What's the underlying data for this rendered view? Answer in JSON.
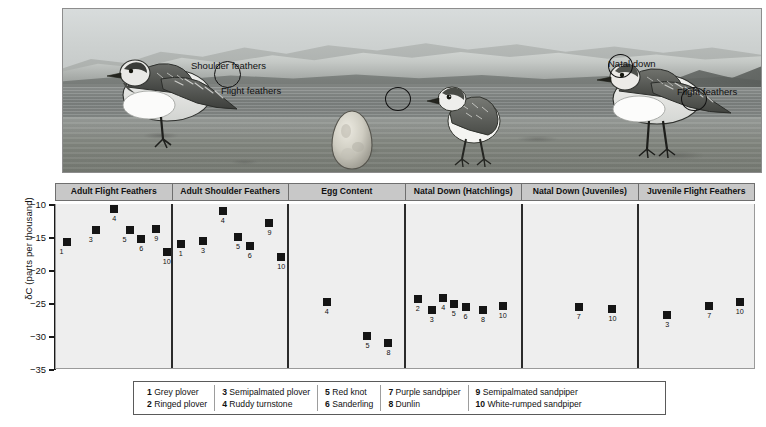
{
  "illustration": {
    "annotations": [
      {
        "label": "Shoulder feathers",
        "x": 191,
        "y": 60
      },
      {
        "label": "Flight feathers",
        "x": 221,
        "y": 85
      },
      {
        "label": "Natal down",
        "x": 608,
        "y": 58
      },
      {
        "label": "Flight feathers",
        "x": 677,
        "y": 86
      }
    ],
    "subjects": [
      "adult-plover-bird",
      "egg",
      "hatchling-chick",
      "juvenile-plover-bird"
    ],
    "scene": "arctic-tundra-shoreline-with-snowy-mountains"
  },
  "chart_data": {
    "type": "scatter",
    "title": "",
    "xlabel": "",
    "ylabel": "δC (parts per thousand)",
    "ylim": [
      -35,
      -10
    ],
    "yticks": [
      -10,
      -15,
      -20,
      -25,
      -30,
      -35
    ],
    "ytick_labels": [
      "−10",
      "−15",
      "−20",
      "−25",
      "−30",
      "−35"
    ],
    "grid": false,
    "legend_position": "bottom",
    "panels": [
      {
        "label": "Adult Flight Feathers",
        "points": [
          {
            "id": "1",
            "x": 0.09,
            "value": -15.7,
            "label_pos": "below-left"
          },
          {
            "id": "3",
            "x": 0.34,
            "value": -14.0,
            "label_pos": "below-left"
          },
          {
            "id": "4",
            "x": 0.5,
            "value": -10.7,
            "label_pos": "below"
          },
          {
            "id": "5",
            "x": 0.63,
            "value": -13.9,
            "label_pos": "below-left"
          },
          {
            "id": "6",
            "x": 0.73,
            "value": -15.3,
            "label_pos": "below"
          },
          {
            "id": "9",
            "x": 0.86,
            "value": -13.8,
            "label_pos": "below"
          },
          {
            "id": "10",
            "x": 0.95,
            "value": -17.3,
            "label_pos": "below"
          }
        ]
      },
      {
        "label": "Adult Shoulder Feathers",
        "points": [
          {
            "id": "1",
            "x": 0.07,
            "value": -16.1,
            "label_pos": "below"
          },
          {
            "id": "3",
            "x": 0.26,
            "value": -15.6,
            "label_pos": "below"
          },
          {
            "id": "4",
            "x": 0.43,
            "value": -11.1,
            "label_pos": "below"
          },
          {
            "id": "5",
            "x": 0.56,
            "value": -15.0,
            "label_pos": "below"
          },
          {
            "id": "6",
            "x": 0.66,
            "value": -16.4,
            "label_pos": "below"
          },
          {
            "id": "9",
            "x": 0.83,
            "value": -12.9,
            "label_pos": "below"
          },
          {
            "id": "10",
            "x": 0.93,
            "value": -18.1,
            "label_pos": "below"
          }
        ]
      },
      {
        "label": "Egg Content",
        "points": [
          {
            "id": "4",
            "x": 0.32,
            "value": -24.8,
            "label_pos": "below"
          },
          {
            "id": "5",
            "x": 0.67,
            "value": -30.0,
            "label_pos": "below"
          },
          {
            "id": "8",
            "x": 0.85,
            "value": -31.0,
            "label_pos": "below"
          }
        ]
      },
      {
        "label": "Natal Down (Hatchlings)",
        "points": [
          {
            "id": "2",
            "x": 0.1,
            "value": -24.4,
            "label_pos": "below"
          },
          {
            "id": "3",
            "x": 0.22,
            "value": -26.1,
            "label_pos": "below"
          },
          {
            "id": "4",
            "x": 0.32,
            "value": -24.2,
            "label_pos": "below"
          },
          {
            "id": "5",
            "x": 0.41,
            "value": -25.1,
            "label_pos": "below"
          },
          {
            "id": "6",
            "x": 0.51,
            "value": -25.6,
            "label_pos": "below"
          },
          {
            "id": "8",
            "x": 0.66,
            "value": -26.1,
            "label_pos": "below"
          },
          {
            "id": "10",
            "x": 0.83,
            "value": -25.5,
            "label_pos": "below"
          }
        ]
      },
      {
        "label": "Natal Down (Juveniles)",
        "points": [
          {
            "id": "7",
            "x": 0.48,
            "value": -25.6,
            "label_pos": "below"
          },
          {
            "id": "10",
            "x": 0.77,
            "value": -25.9,
            "label_pos": "below"
          }
        ]
      },
      {
        "label": "Juvenile Flight Feathers",
        "points": [
          {
            "id": "3",
            "x": 0.24,
            "value": -26.8,
            "label_pos": "below"
          },
          {
            "id": "7",
            "x": 0.6,
            "value": -25.4,
            "label_pos": "below"
          },
          {
            "id": "10",
            "x": 0.86,
            "value": -24.9,
            "label_pos": "below"
          }
        ]
      }
    ]
  },
  "legend": {
    "columns": [
      [
        {
          "num": "1",
          "name": "Grey plover"
        },
        {
          "num": "2",
          "name": "Ringed plover"
        }
      ],
      [
        {
          "num": "3",
          "name": "Semipalmated plover"
        },
        {
          "num": "4",
          "name": "Ruddy turnstone"
        }
      ],
      [
        {
          "num": "5",
          "name": "Red knot"
        },
        {
          "num": "6",
          "name": "Sanderling"
        }
      ],
      [
        {
          "num": "7",
          "name": "Purple sandpiper"
        },
        {
          "num": "8",
          "name": "Dunlin"
        }
      ],
      [
        {
          "num": "9",
          "name": "Semipalmated sandpiper"
        },
        {
          "num": "10",
          "name": "White-rumped sandpiper"
        }
      ]
    ]
  },
  "colors": {
    "marker": "#151515",
    "plot_bg": "#eeeeee",
    "header_bg": "#c8c8c8",
    "axis": "#1a1a1a",
    "divider": "#2b2b2b"
  }
}
